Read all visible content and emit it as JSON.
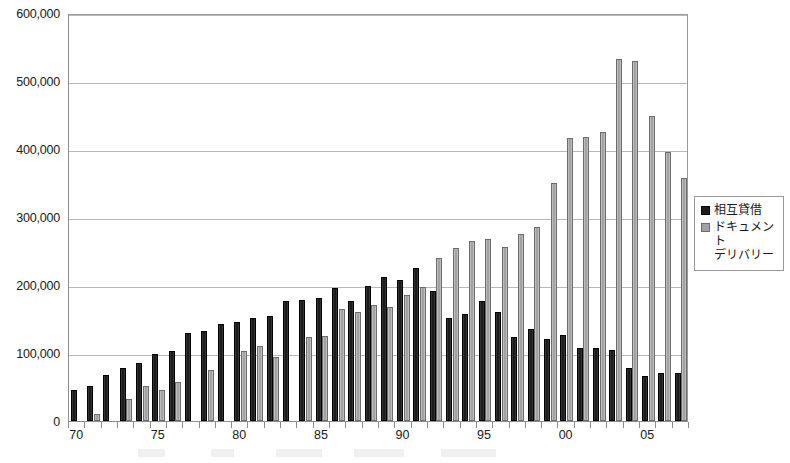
{
  "chart_data": {
    "type": "bar",
    "title": "",
    "xlabel": "",
    "ylabel": "",
    "ylim": [
      0,
      600000
    ],
    "ytick_step": 100000,
    "grid": true,
    "legend_position": "right",
    "categories": [
      "70",
      "71",
      "72",
      "73",
      "74",
      "75",
      "76",
      "77",
      "78",
      "79",
      "80",
      "81",
      "82",
      "83",
      "84",
      "85",
      "86",
      "87",
      "88",
      "89",
      "90",
      "91",
      "92",
      "93",
      "94",
      "95",
      "96",
      "97",
      "98",
      "99",
      "00",
      "01",
      "02",
      "03",
      "04",
      "05",
      "06",
      "07"
    ],
    "xtick_labels": [
      "70",
      "75",
      "80",
      "85",
      "90",
      "95",
      "00",
      "05"
    ],
    "ytick_labels": [
      "0",
      "100,000",
      "200,000",
      "300,000",
      "400,000",
      "500,000",
      "600,000"
    ],
    "series": [
      {
        "name": "相互貸借",
        "color": "#1c1c1c",
        "values": [
          45000,
          52000,
          68000,
          78000,
          86000,
          98000,
          103000,
          130000,
          132000,
          143000,
          146000,
          152000,
          155000,
          176000,
          178000,
          181000,
          195000,
          176000,
          199000,
          212000,
          207000,
          225000,
          191000,
          152000,
          158000,
          177000,
          160000,
          124000,
          135000,
          120000,
          127000,
          108000,
          108000,
          104000,
          78000,
          66000,
          71000,
          70000
        ]
      },
      {
        "name": "ドキュメント\nデリバリー",
        "color": "#a2a2a2",
        "values": [
          0,
          10000,
          0,
          32000,
          51000,
          46000,
          57000,
          0,
          75000,
          0,
          103000,
          111000,
          94000,
          0,
          123000,
          125000,
          165000,
          160000,
          170000,
          168000,
          185000,
          197000,
          239000,
          254000,
          264000,
          267000,
          256000,
          275000,
          286000,
          350000,
          416000,
          417000,
          425000,
          533000,
          529000,
          448000,
          395000,
          357000
        ]
      }
    ]
  },
  "legend": {
    "items": [
      {
        "label": "相互貸借",
        "swatch": "#1c1c1c"
      },
      {
        "label": "ドキュメント\nデリバリー",
        "swatch": "#a2a2a2"
      }
    ]
  }
}
